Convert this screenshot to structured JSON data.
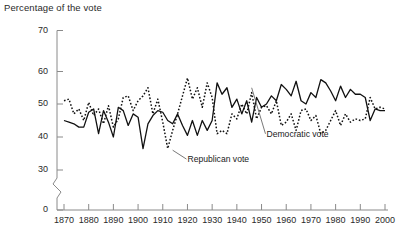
{
  "chart_data": {
    "type": "line",
    "title": "Percentage of the vote",
    "xlabel": "",
    "ylabel": "Percentage of the vote",
    "xlim": [
      1868,
      2000
    ],
    "ylim": [
      30,
      70
    ],
    "axis_break": {
      "from": 0,
      "to": 30,
      "note": "y-axis broken between 0 and 30"
    },
    "grid": false,
    "legend_position": "inline-annotations",
    "yticks": [
      0,
      30,
      40,
      50,
      60,
      70
    ],
    "xticks": [
      1870,
      1880,
      1890,
      1900,
      1910,
      1920,
      1930,
      1940,
      1950,
      1960,
      1970,
      1980,
      1990,
      2000
    ],
    "annotations": [
      {
        "text": "Democratic vote",
        "x": 1952,
        "y": 62,
        "points_to_x": 1946,
        "points_to_y": 55
      },
      {
        "text": "Republican vote",
        "x": 1920,
        "y": 33,
        "points_to_x": 1914,
        "points_to_y": 36
      }
    ],
    "x": [
      1870,
      1872,
      1874,
      1876,
      1878,
      1880,
      1882,
      1884,
      1886,
      1888,
      1890,
      1892,
      1894,
      1896,
      1898,
      1900,
      1902,
      1904,
      1906,
      1908,
      1910,
      1912,
      1914,
      1916,
      1918,
      1920,
      1922,
      1924,
      1926,
      1928,
      1930,
      1932,
      1934,
      1936,
      1938,
      1940,
      1942,
      1944,
      1946,
      1948,
      1950,
      1952,
      1954,
      1956,
      1958,
      1960,
      1962,
      1964,
      1966,
      1968,
      1970,
      1972,
      1974,
      1976,
      1978,
      1980,
      1982,
      1984,
      1986,
      1988,
      1990,
      1992,
      1994,
      1996,
      1998,
      2000
    ],
    "series": [
      {
        "name": "Democratic vote",
        "style": "solid",
        "color": "#111111",
        "values": [
          45,
          44.5,
          44,
          43,
          43,
          47.5,
          48.5,
          41,
          48,
          44.5,
          40,
          49,
          48,
          43.5,
          47,
          46,
          36.5,
          44,
          46.5,
          48,
          47.5,
          45,
          44,
          47,
          43.5,
          40.5,
          45,
          40.5,
          45,
          42,
          45,
          56.5,
          53,
          55,
          49,
          51.5,
          47,
          51,
          44.5,
          52,
          49,
          50,
          52.5,
          51,
          56,
          54.5,
          52.5,
          57,
          51,
          50,
          53.5,
          52,
          57.5,
          56.5,
          54,
          51,
          55.5,
          52,
          54.5,
          53,
          53,
          52,
          45,
          48.5,
          48,
          48
        ]
      },
      {
        "name": "Republican vote",
        "style": "dotted",
        "color": "#111111",
        "values": [
          51,
          51.5,
          47,
          48.5,
          45,
          50.5,
          46.5,
          48.5,
          44,
          49.5,
          43,
          45.5,
          52,
          52.5,
          48,
          51,
          52.5,
          55,
          47,
          51.5,
          44.5,
          36.5,
          42,
          47,
          52.5,
          58,
          51.5,
          55,
          49,
          56.5,
          52,
          41,
          42,
          41,
          47,
          45.5,
          50,
          47,
          53.5,
          45.5,
          49,
          49.5,
          47,
          51,
          43.5,
          44.5,
          47,
          42,
          48,
          48.5,
          45,
          46.5,
          41,
          42,
          45,
          48,
          43.5,
          47,
          44.5,
          45.5,
          45,
          45.5,
          52,
          48.5,
          49,
          48.5
        ]
      }
    ]
  }
}
